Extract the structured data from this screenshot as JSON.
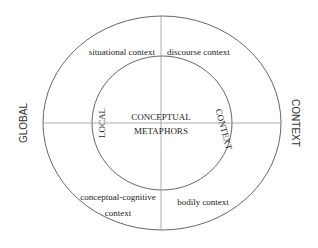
{
  "diagram": {
    "outer_labels": {
      "left": "GLOBAL",
      "right": "CONTEXT"
    },
    "inner_labels": {
      "left": "LOCAL",
      "right": "CONTEXT"
    },
    "center": {
      "line1": "CONCEPTUAL",
      "line2": "METAPHORS"
    },
    "quadrants": {
      "top_left": "situational context",
      "top_right": "discourse context",
      "bottom_left_line1": "conceptual-cognitive",
      "bottom_left_line2": "context",
      "bottom_right": "bodily context"
    },
    "colors": {
      "stroke": "#555555",
      "axis": "#999999",
      "text": "#222222"
    }
  }
}
